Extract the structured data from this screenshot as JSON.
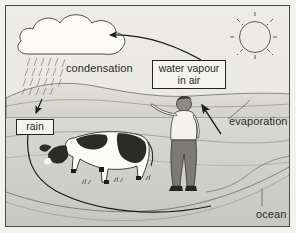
{
  "diagram": {
    "labels": {
      "condensation": "condensation",
      "water_vapour_line1": "water vapour",
      "water_vapour_line2": "in air",
      "rain": "rain",
      "evaporation": "evaporation",
      "ocean": "ocean"
    },
    "elements": {
      "cloud": "cloud-shape",
      "rainfall": "rain-streaks",
      "sun": "sun-with-rays",
      "cow": "cow-figure",
      "person": "person-figure",
      "sea": "ocean-water",
      "hills": "hills-shoreline"
    },
    "arrows": {
      "vapour_to_cloud": "curved-arrow-left",
      "sea_to_vapour": "arrow-up-left",
      "rain_to_sea": "curved-arrow-down"
    },
    "colors": {
      "frame": "#4a4a48",
      "paper": "#eceae6",
      "ink": "#232322",
      "water": "#cfd0cc",
      "sky": "#e7e6e2"
    }
  }
}
